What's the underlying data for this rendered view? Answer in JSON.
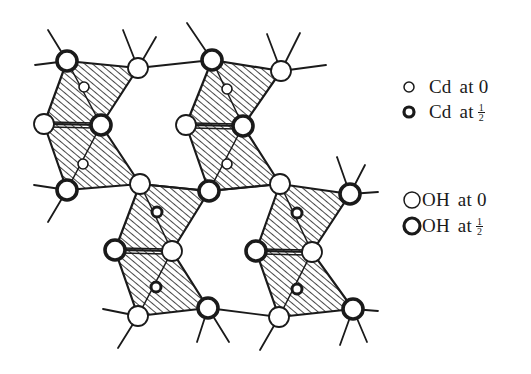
{
  "figure": {
    "colors": {
      "ink": "#1a1a1a",
      "background": "#ffffff",
      "hatch": "#1a1a1a"
    }
  },
  "legend": {
    "items": [
      {
        "symbol": "small-thin-circle",
        "species": "Cd",
        "word": "at",
        "height": "0"
      },
      {
        "symbol": "small-thick-circle",
        "species": "Cd",
        "word": "at",
        "height_num": "1",
        "height_den": "2"
      },
      {
        "symbol": "large-thin-circle",
        "species": "OH",
        "word": "at",
        "height": "0"
      },
      {
        "symbol": "large-thick-circle",
        "species": "OH",
        "word": "at",
        "height_num": "1",
        "height_den": "2"
      }
    ]
  },
  "structure": {
    "oh_atoms": [
      {
        "x": 67,
        "y": 61,
        "level": "half"
      },
      {
        "x": 138,
        "y": 68,
        "level": "zero"
      },
      {
        "x": 44,
        "y": 124,
        "level": "zero"
      },
      {
        "x": 101,
        "y": 125,
        "level": "half"
      },
      {
        "x": 67,
        "y": 190,
        "level": "half"
      },
      {
        "x": 140,
        "y": 184,
        "level": "zero"
      },
      {
        "x": 212,
        "y": 60,
        "level": "half"
      },
      {
        "x": 281,
        "y": 71,
        "level": "zero"
      },
      {
        "x": 186,
        "y": 125,
        "level": "zero"
      },
      {
        "x": 243,
        "y": 126,
        "level": "half"
      },
      {
        "x": 209,
        "y": 191,
        "level": "half"
      },
      {
        "x": 280,
        "y": 184,
        "level": "zero"
      },
      {
        "x": 115,
        "y": 250,
        "level": "half"
      },
      {
        "x": 172,
        "y": 251,
        "level": "zero"
      },
      {
        "x": 138,
        "y": 316,
        "level": "zero"
      },
      {
        "x": 208,
        "y": 308,
        "level": "half"
      },
      {
        "x": 350,
        "y": 194,
        "level": "half"
      },
      {
        "x": 256,
        "y": 251,
        "level": "half"
      },
      {
        "x": 312,
        "y": 252,
        "level": "zero"
      },
      {
        "x": 279,
        "y": 317,
        "level": "zero"
      },
      {
        "x": 353,
        "y": 309,
        "level": "half"
      }
    ],
    "cd_atoms": [
      {
        "x": 84,
        "y": 87,
        "level": "zero"
      },
      {
        "x": 83,
        "y": 164,
        "level": "zero"
      },
      {
        "x": 227,
        "y": 89,
        "level": "zero"
      },
      {
        "x": 227,
        "y": 164,
        "level": "zero"
      },
      {
        "x": 157,
        "y": 212,
        "level": "half"
      },
      {
        "x": 156,
        "y": 287,
        "level": "half"
      },
      {
        "x": 297,
        "y": 213,
        "level": "half"
      },
      {
        "x": 297,
        "y": 289,
        "level": "half"
      }
    ]
  }
}
